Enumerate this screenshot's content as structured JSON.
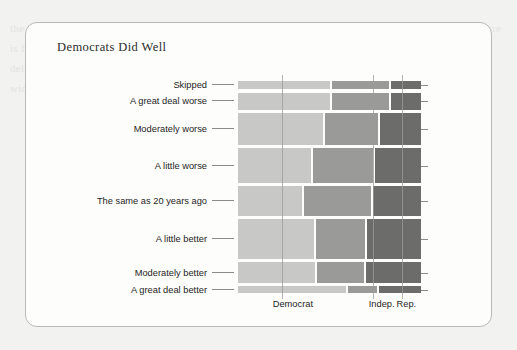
{
  "page": {
    "background_color": "#f2f2f0",
    "ghost_text": "the New Deal to the Great Society and beyond, Democrats built the modern safety net. Today the picture is far more contested. In survey after survey, partisans divide sharply over whether the party has delivered. The mosaic below breaks responses out by self-reported party identification, with column width proportional to group size and row height proportional to response frequency."
  },
  "card": {
    "title": "Democrats Did Well",
    "border_color": "#b9b9b6",
    "background_color": "#fdfdfc"
  },
  "chart_data": {
    "type": "mosaic",
    "title": "Democrats Did Well",
    "xlabel": "",
    "ylabel": "",
    "grid": true,
    "legend_position": "none",
    "x_categories": [
      "Democrat",
      "Indep.",
      "Rep."
    ],
    "x_tick_labels": [
      "Democrat",
      "Indep.",
      "Rep."
    ],
    "x_tick_positions_pct": [
      30.0,
      78.5,
      92.0
    ],
    "y_categories": [
      "Skipped",
      "A great deal worse",
      "Moderately worse",
      "A little worse",
      "The same as 20 years ago",
      "A little better",
      "Moderately better",
      "A great deal better"
    ],
    "colors": {
      "Democrat": "#c8c8c6",
      "Indep.": "#9a9a98",
      "Rep.": "#6c6c6a"
    },
    "vertical_gridlines_pct": [
      24.0,
      74.0,
      89.5
    ],
    "rows": [
      {
        "label": "Skipped",
        "height_pct": 3.8,
        "segments": [
          {
            "group": "Democrat",
            "width_pct": 51.5
          },
          {
            "group": "Indep.",
            "width_pct": 31.5
          },
          {
            "group": "Rep.",
            "width_pct": 17.0
          }
        ]
      },
      {
        "label": "A great deal worse",
        "height_pct": 8.0,
        "segments": [
          {
            "group": "Democrat",
            "width_pct": 51.5
          },
          {
            "group": "Indep.",
            "width_pct": 31.5
          },
          {
            "group": "Rep.",
            "width_pct": 17.0
          }
        ]
      },
      {
        "label": "Moderately worse",
        "height_pct": 14.5,
        "segments": [
          {
            "group": "Democrat",
            "width_pct": 47.5
          },
          {
            "group": "Indep.",
            "width_pct": 29.5
          },
          {
            "group": "Rep.",
            "width_pct": 23.0
          }
        ]
      },
      {
        "label": "A little worse",
        "height_pct": 16.0,
        "segments": [
          {
            "group": "Democrat",
            "width_pct": 41.0
          },
          {
            "group": "Indep.",
            "width_pct": 33.5
          },
          {
            "group": "Rep.",
            "width_pct": 25.5
          }
        ]
      },
      {
        "label": "The same as 20 years ago",
        "height_pct": 13.5,
        "segments": [
          {
            "group": "Democrat",
            "width_pct": 36.0
          },
          {
            "group": "Indep.",
            "width_pct": 37.0
          },
          {
            "group": "Rep.",
            "width_pct": 27.0
          }
        ]
      },
      {
        "label": "A little better",
        "height_pct": 18.5,
        "segments": [
          {
            "group": "Democrat",
            "width_pct": 42.5
          },
          {
            "group": "Indep.",
            "width_pct": 27.5
          },
          {
            "group": "Rep.",
            "width_pct": 30.0
          }
        ]
      },
      {
        "label": "Moderately better",
        "height_pct": 9.5,
        "segments": [
          {
            "group": "Democrat",
            "width_pct": 43.0
          },
          {
            "group": "Indep.",
            "width_pct": 26.5
          },
          {
            "group": "Rep.",
            "width_pct": 30.5
          }
        ]
      },
      {
        "label": "A great deal better",
        "height_pct": 3.0,
        "segments": [
          {
            "group": "Democrat",
            "width_pct": 60.5
          },
          {
            "group": "Indep.",
            "width_pct": 16.0
          },
          {
            "group": "Rep.",
            "width_pct": 23.5
          }
        ]
      }
    ]
  }
}
